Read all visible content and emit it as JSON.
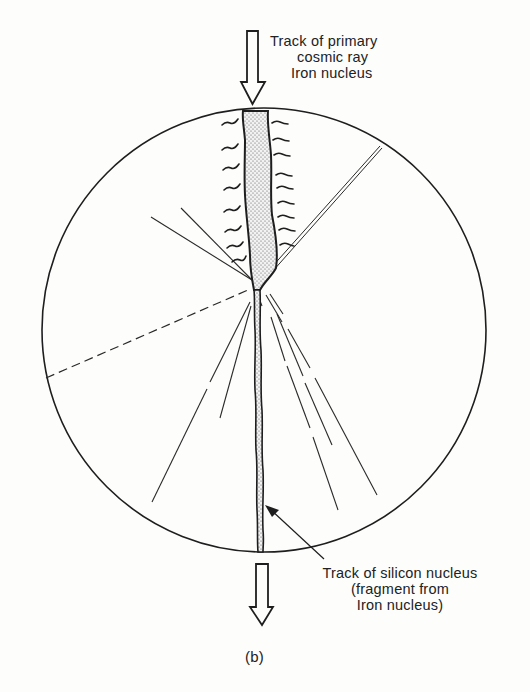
{
  "figure": {
    "caption": "(b)",
    "incoming_label": {
      "lines": [
        "Track of primary",
        "cosmic ray",
        "Iron nucleus"
      ]
    },
    "outgoing_label": {
      "lines": [
        "Track of silicon nucleus",
        "(fragment from",
        "Iron nucleus)"
      ]
    },
    "elements": {
      "detector_circle": {
        "cx": 264,
        "cy": 330,
        "r": 222
      },
      "incoming_arrow": {
        "direction": "down",
        "position": "top"
      },
      "outgoing_arrow": {
        "direction": "down",
        "position": "bottom"
      },
      "primary_track": "wide stippled track with delta-ray wiggles, narrows at interaction point",
      "interaction_point": {
        "x": 256,
        "y": 284
      },
      "secondary_tracks": "fan of fragment tracks (solid, broken, dashed) emanating from interaction point",
      "silicon_track": "narrow stippled track continuing downward to circle bottom"
    },
    "colors": {
      "ink": "#1e1e1e",
      "background": "#fdfdfc",
      "stipple_fill": "#e6e6e6"
    }
  }
}
